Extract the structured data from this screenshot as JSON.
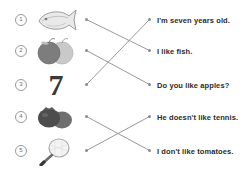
{
  "worksheet": {
    "title": "Matching exercise: pictures to sentences",
    "width": 240,
    "height": 175,
    "background": "#ffffff",
    "line_color": "#8c8c8c",
    "dot_color": "#8c8c8c",
    "text_color": "#2b2b2b"
  },
  "left_items": [
    {
      "number": "1",
      "icon": "fish-icon",
      "label": "fish",
      "dot_y": 20
    },
    {
      "number": "2",
      "icon": "apples-icon",
      "label": "apples",
      "dot_y": 51
    },
    {
      "number": "3",
      "icon": "number-seven-glyph",
      "label": "7",
      "dot_y": 85
    },
    {
      "number": "4",
      "icon": "tomatoes-icon",
      "label": "tomatoes",
      "dot_y": 117
    },
    {
      "number": "5",
      "icon": "tennis-racket-icon",
      "label": "tennis racket",
      "dot_y": 151
    }
  ],
  "right_items": [
    {
      "id": "a",
      "text": "I'm seven years old.",
      "dot_y": 20
    },
    {
      "id": "b",
      "text": "I like fish.",
      "dot_y": 51
    },
    {
      "id": "c",
      "text": "Do you like apples?",
      "dot_y": 85
    },
    {
      "id": "d",
      "text": "He doesn't like tennis.",
      "dot_y": 117
    },
    {
      "id": "e",
      "text": "I don't like tomatoes.",
      "dot_y": 151
    }
  ],
  "connections": [
    {
      "from_index": 0,
      "to_index": 1,
      "from_y": 20,
      "to_y": 51
    },
    {
      "from_index": 1,
      "to_index": 2,
      "from_y": 51,
      "to_y": 85
    },
    {
      "from_index": 2,
      "to_index": 0,
      "from_y": 85,
      "to_y": 20
    },
    {
      "from_index": 3,
      "to_index": 4,
      "from_y": 117,
      "to_y": 151
    },
    {
      "from_index": 4,
      "to_index": 3,
      "from_y": 151,
      "to_y": 117
    }
  ]
}
